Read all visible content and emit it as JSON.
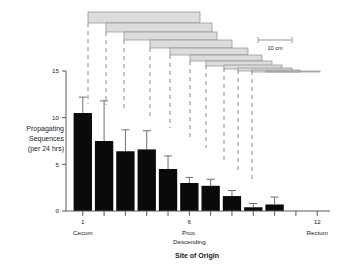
{
  "chart_data": {
    "type": "bar",
    "title": "",
    "xlabel": "Site of Origin",
    "ylabel": "Propagating Sequences (per 24 hrs)",
    "ylabel_lines": [
      "Propagating",
      "Sequences",
      "(per 24 hrs)"
    ],
    "ylim": [
      0,
      15
    ],
    "yticks": [
      0,
      5,
      10,
      15
    ],
    "ytick_labels": [
      "0",
      "5",
      "10",
      "15"
    ],
    "xlim": [
      0.4,
      12.6
    ],
    "xticks": [
      1,
      2,
      3,
      4,
      5,
      6,
      7,
      8,
      9,
      10,
      11,
      12
    ],
    "xtick_labels_shown": [
      "1",
      "6",
      "12"
    ],
    "xtick_label_positions": [
      1,
      6,
      12
    ],
    "x_site_annotations": [
      {
        "position": 1,
        "lines": [
          "Cecum"
        ]
      },
      {
        "position": 6,
        "lines": [
          "Prox.",
          "Descending"
        ]
      },
      {
        "position": 12,
        "lines": [
          "Rectum"
        ]
      }
    ],
    "grid": false,
    "legend": false,
    "categories": [
      1,
      2,
      3,
      4,
      5,
      6,
      7,
      8,
      9,
      10,
      11,
      12
    ],
    "values": [
      10.5,
      7.5,
      6.4,
      6.6,
      4.5,
      3.0,
      2.7,
      1.6,
      0.4,
      0.7,
      0.0,
      0.0
    ],
    "errors_upper": [
      12.2,
      11.8,
      8.7,
      8.6,
      5.9,
      3.6,
      3.4,
      2.2,
      0.8,
      1.5,
      0.0,
      0.0
    ],
    "error_type": "upper-only",
    "bar_color": "#0a0a0a",
    "error_color": "#6e6e6e",
    "axis_color": "#5a5a5a"
  },
  "diagram": {
    "name": "colon-segment-diagram",
    "segment_fill": "#dcdcdc",
    "segment_stroke": "#8e8e8e",
    "dashed_line_color": "#8a8a8a",
    "segments": [
      {
        "index": 1,
        "x_start": 88,
        "x_end": 200,
        "y": 12,
        "height": 11
      },
      {
        "index": 2,
        "x_start": 106,
        "x_end": 212,
        "y": 23,
        "height": 9
      },
      {
        "index": 3,
        "x_start": 124,
        "x_end": 217,
        "y": 32,
        "height": 8
      },
      {
        "index": 4,
        "x_start": 150,
        "x_end": 232,
        "y": 40,
        "height": 8
      },
      {
        "index": 5,
        "x_start": 170,
        "x_end": 248,
        "y": 48,
        "height": 7
      },
      {
        "index": 6,
        "x_start": 190,
        "x_end": 262,
        "y": 55,
        "height": 6
      },
      {
        "index": 7,
        "x_start": 206,
        "x_end": 272,
        "y": 61,
        "height": 5
      },
      {
        "index": 8,
        "x_start": 224,
        "x_end": 282,
        "y": 65,
        "height": 4
      },
      {
        "index": 9,
        "x_start": 238,
        "x_end": 292,
        "y": 68,
        "height": 3
      },
      {
        "index": 10,
        "x_start": 252,
        "x_end": 300,
        "y": 70,
        "height": 2
      },
      {
        "index": 11,
        "x_start": 266,
        "x_end": 320,
        "y": 71,
        "height": 1
      }
    ],
    "dashed_lines": [
      {
        "x": 88,
        "y_top": 23,
        "y_bottom": 104
      },
      {
        "x": 106,
        "y_top": 32,
        "y_bottom": 105
      },
      {
        "x": 124,
        "y_top": 40,
        "y_bottom": 112
      },
      {
        "x": 150,
        "y_top": 48,
        "y_bottom": 120
      },
      {
        "x": 170,
        "y_top": 55,
        "y_bottom": 128
      },
      {
        "x": 190,
        "y_top": 61,
        "y_bottom": 138
      },
      {
        "x": 206,
        "y_top": 65,
        "y_bottom": 148
      },
      {
        "x": 224,
        "y_top": 68,
        "y_bottom": 160
      },
      {
        "x": 238,
        "y_top": 70,
        "y_bottom": 170
      },
      {
        "x": 252,
        "y_top": 71,
        "y_bottom": 182
      }
    ]
  },
  "scale_bar": {
    "label": "10 cm",
    "x_start": 258,
    "x_end": 292,
    "y": 40,
    "color": "#8a8a8a"
  }
}
